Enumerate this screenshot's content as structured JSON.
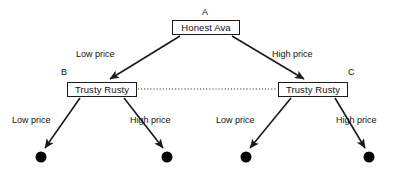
{
  "diagram": {
    "type": "game-tree",
    "background_color": "#ffffff",
    "line_color": "#1a1a1a",
    "text_color": "#111111"
  },
  "nodes": [
    {
      "id": "A",
      "tag": "A",
      "label": "Honest Ava",
      "role": "root",
      "box": {
        "x": 172,
        "y": 20,
        "w": 68,
        "h": 15
      },
      "tag_pos": {
        "x": 202,
        "y": 7
      }
    },
    {
      "id": "B",
      "tag": "B",
      "label": "Trusty Rusty",
      "role": "decision",
      "box": {
        "x": 67,
        "y": 82,
        "w": 70,
        "h": 15
      },
      "tag_pos": {
        "x": 61,
        "y": 67
      }
    },
    {
      "id": "C",
      "tag": "C",
      "label": "Trusty Rusty",
      "role": "decision",
      "box": {
        "x": 278,
        "y": 82,
        "w": 70,
        "h": 15
      },
      "tag_pos": {
        "x": 348,
        "y": 67
      }
    }
  ],
  "terminals": [
    {
      "id": "t1",
      "x": 41,
      "y": 157,
      "r": 5.5
    },
    {
      "id": "t2",
      "x": 167,
      "y": 157,
      "r": 5.5
    },
    {
      "id": "t3",
      "x": 246,
      "y": 157,
      "r": 5.5
    },
    {
      "id": "t4",
      "x": 369,
      "y": 157,
      "r": 5.5
    }
  ],
  "edges": [
    {
      "id": "edge-a-b",
      "from": "A",
      "to": "B",
      "label": "Low price",
      "label_pos": {
        "x": 76,
        "y": 49
      },
      "x1": 180,
      "y1": 36,
      "x2": 110,
      "y2": 79
    },
    {
      "id": "edge-a-c",
      "from": "A",
      "to": "C",
      "label": "High price",
      "label_pos": {
        "x": 272,
        "y": 49
      },
      "x1": 232,
      "y1": 36,
      "x2": 304,
      "y2": 79
    },
    {
      "id": "edge-b-t1",
      "from": "B",
      "to": "t1",
      "label": "Low price",
      "label_pos": {
        "x": 12,
        "y": 115
      },
      "x1": 80,
      "y1": 98,
      "x2": 45,
      "y2": 148
    },
    {
      "id": "edge-b-t2",
      "from": "B",
      "to": "t2",
      "label": "High price",
      "label_pos": {
        "x": 130,
        "y": 115
      },
      "x1": 124,
      "y1": 98,
      "x2": 163,
      "y2": 148
    },
    {
      "id": "edge-c-t3",
      "from": "C",
      "to": "t3",
      "label": "Low price",
      "label_pos": {
        "x": 216,
        "y": 115
      },
      "x1": 291,
      "y1": 98,
      "x2": 250,
      "y2": 148
    },
    {
      "id": "edge-c-t4",
      "from": "C",
      "to": "t4",
      "label": "High price",
      "label_pos": {
        "x": 336,
        "y": 115
      },
      "x1": 335,
      "y1": 98,
      "x2": 365,
      "y2": 148
    }
  ],
  "information_set": {
    "id": "infoset-bc",
    "style": "dotted",
    "from": "B",
    "to": "C",
    "x1": 138,
    "y1": 89,
    "x2": 277,
    "y2": 89
  }
}
